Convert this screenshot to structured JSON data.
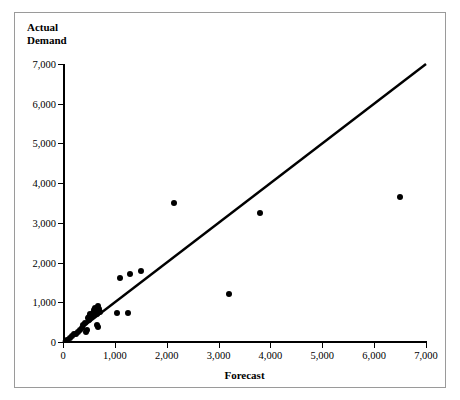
{
  "chart_data": {
    "type": "scatter",
    "title": "Actual\nDemand",
    "xlabel": "Forecast",
    "ylabel": "Actual Demand",
    "xlim": [
      0,
      7000
    ],
    "ylim": [
      0,
      7000
    ],
    "xticks": [
      0,
      1000,
      2000,
      3000,
      4000,
      5000,
      6000,
      7000
    ],
    "yticks": [
      0,
      1000,
      2000,
      3000,
      4000,
      5000,
      6000,
      7000
    ],
    "xticklabels": [
      "0",
      "1,000",
      "2,000",
      "3,000",
      "4,000",
      "5,000",
      "6,000",
      "7,000"
    ],
    "yticklabels": [
      "0",
      "1,000",
      "2,000",
      "3,000",
      "4,000",
      "5,000",
      "6,000",
      "7,000"
    ],
    "grid": false,
    "legend": false,
    "marker_color": "#000000",
    "line_color": "#000000",
    "reference_line": {
      "name": "45-degree perfect-forecast line",
      "from": [
        0,
        0
      ],
      "to": [
        7000,
        7000
      ]
    },
    "points": [
      [
        80,
        60
      ],
      [
        130,
        110
      ],
      [
        170,
        150
      ],
      [
        210,
        190
      ],
      [
        250,
        210
      ],
      [
        290,
        260
      ],
      [
        320,
        300
      ],
      [
        360,
        340
      ],
      [
        390,
        420
      ],
      [
        420,
        470
      ],
      [
        440,
        250
      ],
      [
        470,
        300
      ],
      [
        480,
        600
      ],
      [
        500,
        560
      ],
      [
        510,
        640
      ],
      [
        530,
        700
      ],
      [
        560,
        660
      ],
      [
        580,
        730
      ],
      [
        600,
        800
      ],
      [
        610,
        860
      ],
      [
        630,
        760
      ],
      [
        650,
        700
      ],
      [
        660,
        430
      ],
      [
        670,
        380
      ],
      [
        680,
        900
      ],
      [
        700,
        820
      ],
      [
        720,
        760
      ],
      [
        1050,
        720
      ],
      [
        1250,
        720
      ],
      [
        1100,
        1600
      ],
      [
        1300,
        1700
      ],
      [
        1500,
        1800
      ],
      [
        2150,
        3500
      ],
      [
        3200,
        1200
      ],
      [
        3800,
        3250
      ],
      [
        6500,
        3650
      ]
    ]
  }
}
